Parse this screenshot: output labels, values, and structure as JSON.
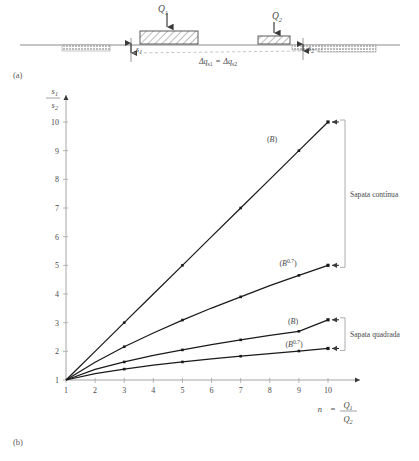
{
  "figure": {
    "panel_a_label": "(a)",
    "panel_b_label": "(b)"
  },
  "diagram_a": {
    "load_1": "Q1",
    "load_1_text": "Q",
    "load_1_sub": "1",
    "load_2_text": "Q",
    "load_2_sub": "2",
    "settlement_1_text": "s",
    "settlement_1_sub": "1",
    "settlement_2_text": "s",
    "settlement_2_sub": "2",
    "stress_equality": "Δq",
    "stress_sub_1": "s1",
    "stress_eq_sign": "=",
    "stress_2": "Δq",
    "stress_sub_2": "s2"
  },
  "chart_data": {
    "type": "line",
    "title": "",
    "xlabel_prefix": "n",
    "xlabel_eq": "=",
    "xlabel_num": "Q",
    "xlabel_num_sub": "1",
    "xlabel_den": "Q",
    "xlabel_den_sub": "2",
    "ylabel_num": "s",
    "ylabel_num_sub": "1",
    "ylabel_den": "s",
    "ylabel_den_sub": "2",
    "xlim": [
      1,
      10
    ],
    "ylim": [
      1,
      10
    ],
    "xticks": [
      1,
      2,
      3,
      4,
      5,
      6,
      7,
      8,
      9,
      10
    ],
    "yticks": [
      1,
      2,
      3,
      4,
      5,
      6,
      7,
      8,
      9,
      10
    ],
    "grid": false,
    "legend": "inline-labels",
    "x": [
      1,
      2,
      3,
      4,
      5,
      6,
      7,
      8,
      9,
      10
    ],
    "series": [
      {
        "name": "(B)",
        "label_text": "B",
        "label_exp": "",
        "group": "Sapata contínua",
        "values": [
          1,
          2.0,
          3.0,
          4.0,
          5.0,
          6.0,
          7.0,
          8.0,
          9.0,
          10.0
        ]
      },
      {
        "name": "(B^0.7)",
        "label_text": "B",
        "label_exp": "0.7",
        "group": "Sapata contínua",
        "values": [
          1,
          1.62,
          2.16,
          2.64,
          3.09,
          3.51,
          3.9,
          4.29,
          4.65,
          5.0
        ]
      },
      {
        "name": "(B)",
        "label_text": "B",
        "label_exp": "",
        "group": "Sapata quadrada",
        "values": [
          1,
          1.37,
          1.63,
          1.86,
          2.05,
          2.23,
          2.4,
          2.56,
          2.7,
          3.1
        ]
      },
      {
        "name": "(B^0.7)",
        "label_text": "B",
        "label_exp": "0.7",
        "group": "Sapata quadrada",
        "values": [
          1,
          1.22,
          1.38,
          1.52,
          1.63,
          1.74,
          1.83,
          1.92,
          2.01,
          2.1
        ]
      }
    ],
    "annotations": [
      {
        "text": "Sapata contínua",
        "for": "group-1"
      },
      {
        "text": "Sapata quadrada",
        "for": "group-2"
      }
    ]
  },
  "colors": {
    "line": "#1a1a1a",
    "axis": "#9a9a9a",
    "text": "#4a4a4a",
    "ground": "#8a8a8a",
    "hatch": "#6a6a6a"
  }
}
